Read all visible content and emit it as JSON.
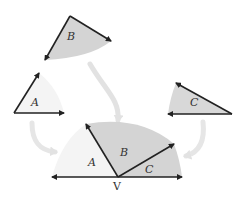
{
  "labels": {
    "sector_b": "B",
    "angle_a": "A",
    "angle_c": "C",
    "combined_a": "A",
    "combined_b": "B",
    "combined_c": "C",
    "vertex": "V"
  },
  "colors": {
    "dark_fill": "#d4d4d4",
    "light_fill": "#f4f4f4",
    "line": "#222222",
    "flow_arrow": "#e2e2e2"
  }
}
